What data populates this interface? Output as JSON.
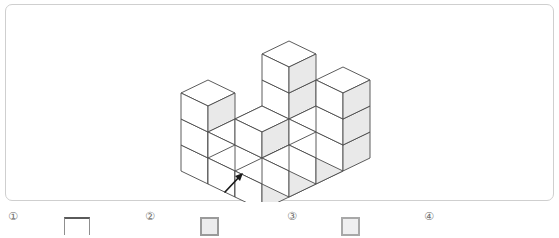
{
  "page": {
    "background_color": "#ffffff",
    "panel_border_color": "#cfcfcf"
  },
  "figure": {
    "name": "isometric-cube-stack",
    "cube_face_colors": {
      "top": "#ffffff",
      "left": "#ffffff",
      "right": "#e9e9e9",
      "edge": "#4a4a4a"
    },
    "arrow": {
      "name": "pointer-arrow",
      "color": "#1a1a1a",
      "direction": "up-right"
    },
    "cube_columns": [
      {
        "x": 0,
        "y": 0,
        "height": 3
      },
      {
        "x": 1,
        "y": 0,
        "height": 1
      },
      {
        "x": 2,
        "y": 0,
        "height": 1
      },
      {
        "x": 3,
        "y": 0,
        "height": 1
      },
      {
        "x": 3,
        "y": 1,
        "height": 2
      },
      {
        "x": 3,
        "y": 2,
        "height": 3
      },
      {
        "x": 0,
        "y": 1,
        "height": 1
      },
      {
        "x": 1,
        "y": 1,
        "height": 2
      },
      {
        "x": 2,
        "y": 1,
        "height": 1
      },
      {
        "x": 0,
        "y": 2,
        "height": 1
      },
      {
        "x": 1,
        "y": 2,
        "height": 1
      },
      {
        "x": 2,
        "y": 2,
        "height": 1
      }
    ]
  },
  "options": [
    {
      "id": "option-1",
      "label": "①",
      "swatch": "cropped-line",
      "label_x": 8,
      "swatch_x": 64
    },
    {
      "id": "option-2",
      "label": "②",
      "swatch": "gray-square",
      "label_x": 145,
      "swatch_x": 200
    },
    {
      "id": "option-3",
      "label": "③",
      "swatch": "light-gray-square",
      "label_x": 287,
      "swatch_x": 341
    },
    {
      "id": "option-4",
      "label": "④",
      "swatch": "none",
      "label_x": 424,
      "swatch_x": 0
    }
  ]
}
